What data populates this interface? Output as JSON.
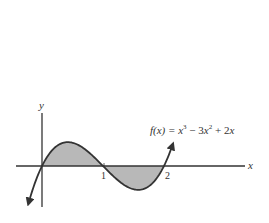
{
  "chart_data": {
    "type": "area",
    "title": "",
    "function_label": "f(x) = x^3 - 3x^2 + 2x",
    "xlabel": "x",
    "ylabel": "y",
    "x_ticks": [
      1,
      2
    ],
    "x_tick_labels": [
      "1",
      "2"
    ],
    "xlim": [
      -0.42,
      3.3
    ],
    "ylim": [
      -0.66,
      0.86
    ],
    "grid": false,
    "legend": "none",
    "series": [
      {
        "name": "f(x) = x^3 - 3x^2 + 2x",
        "x": [
          -0.23,
          0,
          0.25,
          0.42,
          0.75,
          1,
          1.25,
          1.58,
          1.75,
          2,
          2.15
        ],
        "y": [
          -0.63,
          0,
          0.33,
          0.38,
          0.28,
          0,
          -0.28,
          -0.38,
          -0.33,
          0,
          0.39
        ]
      }
    ],
    "shaded_regions": [
      {
        "from": 0,
        "to": 1,
        "description": "area between curve and x-axis, above axis"
      },
      {
        "from": 1,
        "to": 2,
        "description": "area between curve and x-axis, below axis"
      }
    ],
    "colors": {
      "curve": "#333333",
      "fill": "#b8b8b8",
      "axis": "#333333"
    }
  },
  "labels": {
    "x_axis": "x",
    "y_axis": "y",
    "tick_1": "1",
    "tick_2": "2",
    "formula_lhs": "f(x) = ",
    "formula_x3": "x",
    "formula_exp3": "3",
    "formula_mid": " − 3",
    "formula_x2": "x",
    "formula_exp2": "2",
    "formula_tail": " + 2",
    "formula_x": "x"
  }
}
